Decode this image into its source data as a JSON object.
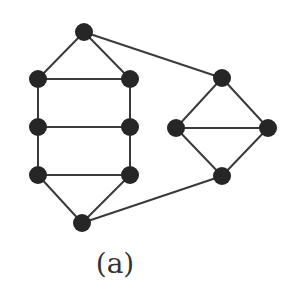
{
  "diagram": {
    "caption": "(a)",
    "node_color": "#262626",
    "edge_color": "#3a3a3a",
    "nodes": [
      {
        "id": "t",
        "x": 84,
        "y": 32
      },
      {
        "id": "l1",
        "x": 38,
        "y": 79
      },
      {
        "id": "r1",
        "x": 130,
        "y": 79
      },
      {
        "id": "l2",
        "x": 38,
        "y": 127
      },
      {
        "id": "r2",
        "x": 130,
        "y": 127
      },
      {
        "id": "l3",
        "x": 38,
        "y": 175
      },
      {
        "id": "r3",
        "x": 130,
        "y": 175
      },
      {
        "id": "b",
        "x": 82,
        "y": 223
      },
      {
        "id": "dt",
        "x": 222,
        "y": 78
      },
      {
        "id": "dl",
        "x": 176,
        "y": 128
      },
      {
        "id": "dr",
        "x": 268,
        "y": 128
      },
      {
        "id": "db",
        "x": 222,
        "y": 176
      }
    ],
    "edges": [
      [
        "t",
        "l1"
      ],
      [
        "t",
        "r1"
      ],
      [
        "l1",
        "r1"
      ],
      [
        "l1",
        "l2"
      ],
      [
        "r1",
        "r2"
      ],
      [
        "l2",
        "r2"
      ],
      [
        "l2",
        "l3"
      ],
      [
        "r2",
        "r3"
      ],
      [
        "l3",
        "r3"
      ],
      [
        "l3",
        "b"
      ],
      [
        "r3",
        "b"
      ],
      [
        "t",
        "dt"
      ],
      [
        "b",
        "db"
      ],
      [
        "dt",
        "dl"
      ],
      [
        "dt",
        "dr"
      ],
      [
        "dl",
        "dr"
      ],
      [
        "dl",
        "db"
      ],
      [
        "dr",
        "db"
      ]
    ]
  }
}
